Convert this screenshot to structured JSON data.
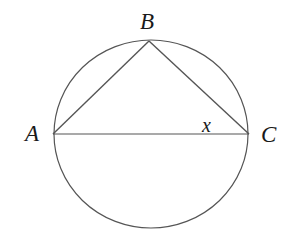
{
  "diagram": {
    "type": "inscribed triangle in circle",
    "colors": {
      "stroke": "#555555",
      "label": "#1a1a1a",
      "background": "#ffffff"
    },
    "circle": {
      "cx": 151,
      "cy": 134,
      "rx": 97,
      "ry": 94
    },
    "points": {
      "A": {
        "label": "A",
        "x": 53,
        "y": 134
      },
      "B": {
        "label": "B",
        "x": 149,
        "y": 41
      },
      "C": {
        "label": "C",
        "x": 249,
        "y": 134
      }
    },
    "segments": [
      "AB",
      "BC",
      "AC"
    ],
    "angle_label": {
      "text": "x",
      "at_vertex": "C"
    }
  }
}
